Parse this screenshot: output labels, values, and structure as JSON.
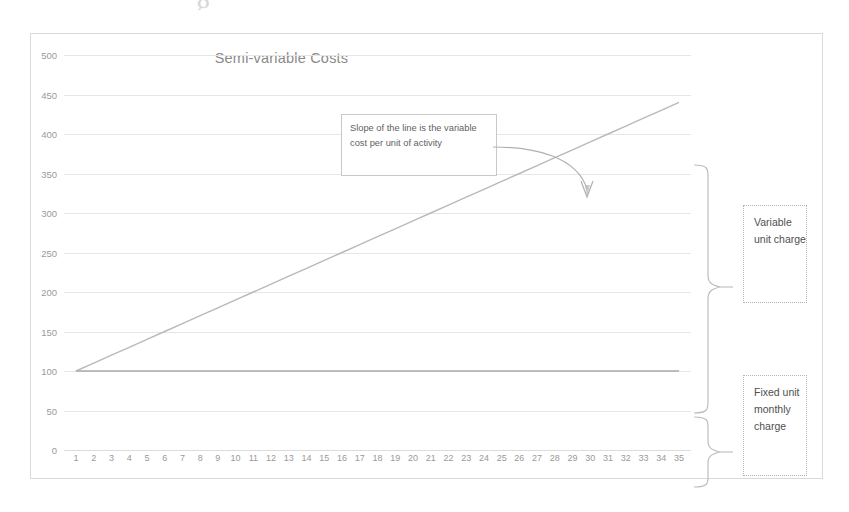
{
  "page": {
    "top_artifact_text": "g"
  },
  "chart": {
    "title": "Semi-variable Costs",
    "callout": {
      "text": "Slope of the line is the variable cost per unit of activity"
    },
    "side_labels": [
      {
        "id": "variable",
        "text": "Variable unit charge"
      },
      {
        "id": "fixed",
        "text": "Fixed unit monthly charge"
      }
    ]
  },
  "chart_data": {
    "type": "line",
    "title": "Semi-variable Costs",
    "xlabel": "",
    "ylabel": "",
    "xlim": [
      1,
      35
    ],
    "ylim": [
      0,
      500
    ],
    "grid": true,
    "legend": false,
    "yticks": [
      0,
      50,
      100,
      150,
      200,
      250,
      300,
      350,
      400,
      450,
      500
    ],
    "ytick_labels": [
      "0",
      "50",
      "100",
      "150",
      "200",
      "250",
      "300",
      "350",
      "400",
      "450",
      "500"
    ],
    "x": [
      1,
      2,
      3,
      4,
      5,
      6,
      7,
      8,
      9,
      10,
      11,
      12,
      13,
      14,
      15,
      16,
      17,
      18,
      19,
      20,
      21,
      22,
      23,
      24,
      25,
      26,
      27,
      28,
      29,
      30,
      31,
      32,
      33,
      34,
      35
    ],
    "xtick_labels": [
      "1",
      "2",
      "3",
      "4",
      "5",
      "6",
      "7",
      "8",
      "9",
      "10",
      "11",
      "12",
      "13",
      "14",
      "15",
      "16",
      "17",
      "18",
      "19",
      "20",
      "21",
      "22",
      "23",
      "24",
      "25",
      "26",
      "27",
      "28",
      "29",
      "30",
      "31",
      "32",
      "33",
      "34",
      "35"
    ],
    "series": [
      {
        "name": "Total semi-variable cost",
        "color": "#b9b9b9",
        "values": [
          100,
          110,
          120,
          130,
          140,
          150,
          160,
          170,
          180,
          190,
          200,
          210,
          220,
          230,
          240,
          250,
          260,
          270,
          280,
          290,
          300,
          310,
          320,
          330,
          340,
          350,
          360,
          370,
          380,
          390,
          400,
          410,
          420,
          430,
          440
        ]
      },
      {
        "name": "Fixed cost",
        "color": "#a8a8a8",
        "values": [
          100,
          100,
          100,
          100,
          100,
          100,
          100,
          100,
          100,
          100,
          100,
          100,
          100,
          100,
          100,
          100,
          100,
          100,
          100,
          100,
          100,
          100,
          100,
          100,
          100,
          100,
          100,
          100,
          100,
          100,
          100,
          100,
          100,
          100,
          100
        ]
      }
    ],
    "annotations": [
      {
        "text": "Slope of the line is the variable cost per unit of activity",
        "points_to_x": 30,
        "points_to_y": 390
      },
      {
        "text": "Variable unit charge",
        "brace_from_y": 100,
        "brace_to_y": 440
      },
      {
        "text": "Fixed unit monthly charge",
        "brace_from_y": 0,
        "brace_to_y": 100
      }
    ],
    "colors": {
      "gridline": "#e6e6e6",
      "axis_text": "#9a9a9a",
      "title": "#8a8a8a",
      "frame": "#d9d9d9"
    }
  }
}
